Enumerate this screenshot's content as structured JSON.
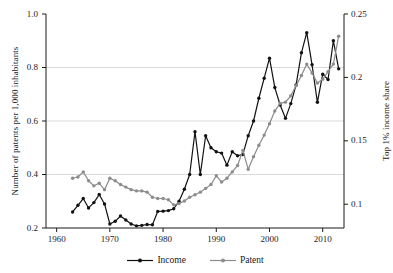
{
  "chart_data": {
    "type": "line",
    "title": "",
    "xlabel": "",
    "ylabel": "Number of patents per 1,000 inhabitants",
    "ylabel_right": "Top 1% income share",
    "xlim": [
      1958,
      2014
    ],
    "ylim": [
      0.2,
      1.0
    ],
    "ylim_right": [
      0.08125,
      0.25
    ],
    "grid": true,
    "legend_position": "bottom",
    "xticks": [
      "1960",
      "1970",
      "1980",
      "1990",
      "2000",
      "2010"
    ],
    "xtick_values": [
      1960,
      1970,
      1980,
      1990,
      2000,
      2010
    ],
    "yticks_left": [
      "0.2",
      "0.4",
      "0.6",
      "0.8",
      "1.0"
    ],
    "ytick_values_left": [
      0.2,
      0.4,
      0.6,
      0.8,
      1.0
    ],
    "yticks_right": [
      "0.1",
      "0.15",
      "0.2",
      "0.25"
    ],
    "ytick_values_right": [
      0.1,
      0.15,
      0.2,
      0.25
    ],
    "x": [
      1963,
      1964,
      1965,
      1966,
      1967,
      1968,
      1969,
      1970,
      1971,
      1972,
      1973,
      1974,
      1975,
      1976,
      1977,
      1978,
      1979,
      1980,
      1981,
      1982,
      1983,
      1984,
      1985,
      1986,
      1987,
      1988,
      1989,
      1990,
      1991,
      1992,
      1993,
      1994,
      1995,
      1996,
      1997,
      1998,
      1999,
      2000,
      2001,
      2002,
      2003,
      2004,
      2005,
      2006,
      2007,
      2008,
      2009,
      2010,
      2011,
      2012,
      2013
    ],
    "series": [
      {
        "name": "Income",
        "axis": "left",
        "color": "#111111",
        "marker": "circle",
        "values": [
          0.26,
          0.285,
          0.31,
          0.275,
          0.295,
          0.325,
          0.29,
          0.215,
          0.225,
          0.245,
          0.23,
          0.215,
          0.208,
          0.21,
          0.213,
          0.212,
          0.262,
          0.263,
          0.265,
          0.272,
          0.3,
          0.345,
          0.4,
          0.56,
          0.4,
          0.545,
          0.5,
          0.485,
          0.48,
          0.435,
          0.485,
          0.47,
          0.475,
          0.545,
          0.6,
          0.685,
          0.76,
          0.835,
          0.725,
          0.66,
          0.61,
          0.665,
          0.735,
          0.855,
          0.93,
          0.81,
          0.67,
          0.775,
          0.755,
          0.9,
          0.795
        ]
      },
      {
        "name": "Patent",
        "axis": "right",
        "color": "#8c8c8c",
        "marker": "circle",
        "values": [
          0.1205,
          0.1215,
          0.1255,
          0.1185,
          0.1145,
          0.1165,
          0.1115,
          0.1205,
          0.1185,
          0.1155,
          0.1135,
          0.1115,
          0.1105,
          0.1105,
          0.1095,
          0.1055,
          0.1045,
          0.1045,
          0.1035,
          0.0995,
          0.1005,
          0.1025,
          0.1055,
          0.1075,
          0.1095,
          0.1125,
          0.1155,
          0.1225,
          0.1175,
          0.1205,
          0.1255,
          0.1305,
          0.1425,
          0.1275,
          0.1375,
          0.1465,
          0.1545,
          0.1635,
          0.1735,
          0.1795,
          0.1805,
          0.1855,
          0.1935,
          0.2015,
          0.2105,
          0.2035,
          0.1955,
          0.1985,
          0.2045,
          0.2105,
          0.2325
        ]
      }
    ]
  },
  "legend": {
    "items": [
      {
        "label": "Income",
        "color": "#111111"
      },
      {
        "label": "Patent",
        "color": "#8c8c8c"
      }
    ]
  }
}
